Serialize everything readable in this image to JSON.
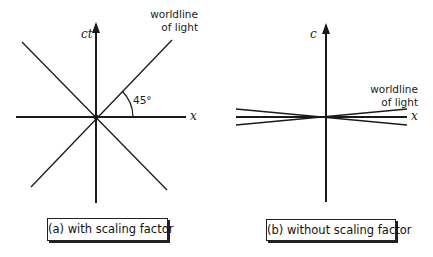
{
  "diagrams": [
    {
      "id": "a",
      "vertical_axis_label": "ct",
      "horizontal_axis_label": "x",
      "worldline_label_line1": "worldline",
      "worldline_label_line2": "of light",
      "angle_label": "45°",
      "caption": "(a) with scaling factor"
    },
    {
      "id": "b",
      "vertical_axis_label": "c",
      "horizontal_axis_label": "x",
      "worldline_label_line1": "worldline",
      "worldline_label_line2": "of light",
      "caption": "(b) without scaling factor"
    }
  ],
  "colors": {
    "line": "#1a1a1a",
    "background": "#ffffff"
  }
}
